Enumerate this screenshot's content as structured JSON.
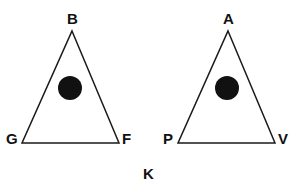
{
  "figure": {
    "title": "",
    "background_color": "#ffffff",
    "stroke_color": "#1a1a1a",
    "fill_color": "#111111",
    "stroke_width": 1.5,
    "caption": {
      "text": "K",
      "x": 143,
      "y": 166
    },
    "shapes": [
      {
        "name": "left-triangle",
        "type": "triangle",
        "apex": {
          "x": 72,
          "y": 31
        },
        "bottom_left": {
          "x": 22,
          "y": 143
        },
        "bottom_right": {
          "x": 119,
          "y": 143
        },
        "vertex_labels": [
          {
            "name": "B",
            "text": "B",
            "x": 67,
            "y": 11
          },
          {
            "name": "G",
            "text": "G",
            "x": 6,
            "y": 131
          },
          {
            "name": "F",
            "text": "F",
            "x": 122,
            "y": 131
          }
        ],
        "circle": {
          "name": "left-circle",
          "cx": 70,
          "cy": 88,
          "r": 12,
          "fill": "#111111"
        }
      },
      {
        "name": "right-triangle",
        "type": "triangle",
        "apex": {
          "x": 228,
          "y": 31
        },
        "bottom_left": {
          "x": 178,
          "y": 143
        },
        "bottom_right": {
          "x": 275,
          "y": 143
        },
        "vertex_labels": [
          {
            "name": "A",
            "text": "A",
            "x": 223,
            "y": 11
          },
          {
            "name": "P",
            "text": "P",
            "x": 163,
            "y": 131
          },
          {
            "name": "V",
            "text": "V",
            "x": 278,
            "y": 131
          }
        ],
        "circle": {
          "name": "right-circle",
          "cx": 227,
          "cy": 88,
          "r": 12,
          "fill": "#111111"
        }
      }
    ]
  }
}
